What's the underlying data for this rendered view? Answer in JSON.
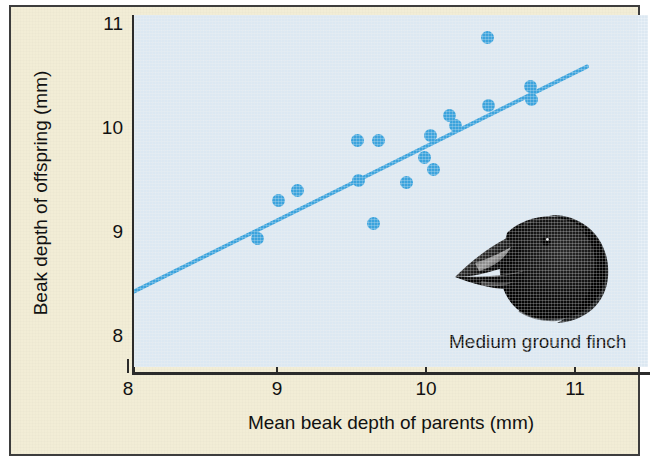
{
  "figure": {
    "background_color": "#f2edd6",
    "plot_background_color": "#dce8f2",
    "border_color": "#3d3d3d"
  },
  "caption": {
    "finch_label": "Medium ground finch",
    "photo_name": "medium-ground-finch-head-photo"
  },
  "chart_data": {
    "type": "scatter",
    "title": "",
    "xlabel": "Mean beak depth of parents (mm)",
    "ylabel": "Beak depth of offspring (mm)",
    "xlim": [
      7.78,
      11.23
    ],
    "ylim": [
      7.62,
      11.0
    ],
    "xticks": [
      8,
      9,
      10,
      11
    ],
    "xtick_labels": [
      "8",
      "9",
      "10",
      "11"
    ],
    "yticks": [
      8,
      9,
      10,
      11
    ],
    "ytick_labels": [
      "8",
      "9",
      "10",
      "11"
    ],
    "grid": false,
    "legend": false,
    "marker_color": "#3ba3dd",
    "line_color": "#3ba3dd",
    "points": [
      {
        "x": 8.87,
        "y": 8.94
      },
      {
        "x": 9.01,
        "y": 9.3
      },
      {
        "x": 9.14,
        "y": 9.4
      },
      {
        "x": 9.54,
        "y": 9.88
      },
      {
        "x": 9.55,
        "y": 9.5
      },
      {
        "x": 9.65,
        "y": 9.08
      },
      {
        "x": 9.68,
        "y": 9.88
      },
      {
        "x": 9.87,
        "y": 9.48
      },
      {
        "x": 9.99,
        "y": 9.72
      },
      {
        "x": 10.03,
        "y": 9.93
      },
      {
        "x": 10.05,
        "y": 9.6
      },
      {
        "x": 10.16,
        "y": 10.12
      },
      {
        "x": 10.2,
        "y": 10.02
      },
      {
        "x": 10.41,
        "y": 10.87
      },
      {
        "x": 10.42,
        "y": 10.22
      },
      {
        "x": 10.7,
        "y": 10.4
      },
      {
        "x": 10.71,
        "y": 10.27
      }
    ],
    "trendline": {
      "x_start": 8.0,
      "y_start": 8.4,
      "x_end": 11.08,
      "y_end": 10.59
    }
  }
}
